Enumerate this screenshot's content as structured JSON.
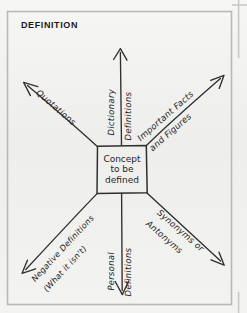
{
  "page": {
    "title": "Definition",
    "background_color": "#f2f2f1",
    "ink_color": "#2a2a2a"
  },
  "diagram": {
    "type": "mind-map",
    "center_node": {
      "line1": "Concept",
      "line2": "to be",
      "line3": "defined"
    },
    "branches": [
      {
        "id": "quotations",
        "label": "Quotations",
        "direction": "upper-left",
        "arrow": "end"
      },
      {
        "id": "dictionary-definitions",
        "label_line1": "Dictionary",
        "label_line2": "Definitions",
        "direction": "up",
        "arrow": "end"
      },
      {
        "id": "important-facts-and-figures",
        "label_line1": "Important Facts",
        "label_line2": "and Figures",
        "direction": "upper-right",
        "arrow": "end"
      },
      {
        "id": "synonyms-or-antonyms",
        "label_line1": "Synonyms or",
        "label_line2": "Antonyms",
        "direction": "lower-right",
        "arrow": "end"
      },
      {
        "id": "personal-definitions",
        "label_line1": "Personal",
        "label_line2": "Definitions",
        "direction": "down",
        "arrow": "end"
      },
      {
        "id": "negative-definitions",
        "label_line1": "Negative Definitions",
        "label_line2": "(What it isn't)",
        "direction": "lower-left",
        "arrow": "end"
      }
    ]
  }
}
